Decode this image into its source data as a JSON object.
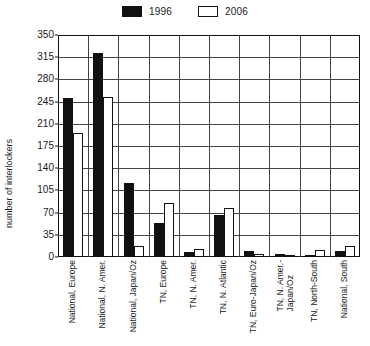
{
  "chart_data": {
    "type": "bar",
    "title": "",
    "subtitle": "",
    "xlabel": "",
    "ylabel": "number of interlockers",
    "ylim": [
      0,
      350
    ],
    "yticks": [
      0,
      35,
      70,
      105,
      140,
      175,
      210,
      245,
      280,
      315,
      350
    ],
    "grid": true,
    "legend_position": "top-center",
    "categories": [
      "National, Europe",
      "National, N. Amer.",
      "National, Japan/Oz",
      "TN, Europe",
      "TN, N. Amer.",
      "TN, N. Atlantic",
      "TN, Euro-Japan/Oz",
      "TN, N. Amer.-\nJapan/Oz",
      "TN, North-South",
      "National, South"
    ],
    "series": [
      {
        "name": "1996",
        "color": "#111111",
        "style": "filled",
        "values": [
          250,
          322,
          117,
          53,
          8,
          66,
          9,
          5,
          2,
          9
        ]
      },
      {
        "name": "2006",
        "color": "#ffffff",
        "style": "hollow",
        "values": [
          195,
          252,
          17,
          85,
          12,
          77,
          5,
          3,
          11,
          17
        ]
      }
    ]
  },
  "legend": {
    "entries": [
      {
        "label": "1996",
        "style": "filled"
      },
      {
        "label": "2006",
        "style": "hollow"
      }
    ]
  },
  "colors": {
    "series_1996": "#111111",
    "series_2006": "#ffffff",
    "axis": "#111111",
    "grid": "#444444",
    "background": "#ffffff"
  }
}
